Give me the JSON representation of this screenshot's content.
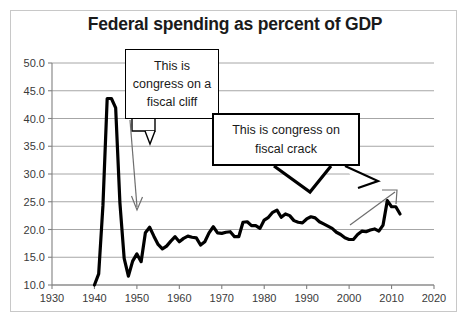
{
  "chart_data": {
    "type": "line",
    "title": "Federal spending as percent of GDP",
    "xlabel": "",
    "ylabel": "",
    "xlim": [
      1930,
      2020
    ],
    "ylim": [
      10.0,
      50.0
    ],
    "grid": true,
    "legend": "none",
    "x_ticks": [
      "1930",
      "1940",
      "1950",
      "1960",
      "1970",
      "1980",
      "1990",
      "2000",
      "2010",
      "2020"
    ],
    "y_ticks": [
      "10.0",
      "15.0",
      "20.0",
      "25.0",
      "30.0",
      "35.0",
      "40.0",
      "45.0",
      "50.0"
    ],
    "series": [
      {
        "name": "Federal spending as percent of GDP",
        "color": "#000000",
        "x": [
          1940,
          1941,
          1942,
          1943,
          1944,
          1945,
          1946,
          1947,
          1948,
          1949,
          1950,
          1951,
          1952,
          1953,
          1954,
          1955,
          1956,
          1957,
          1958,
          1959,
          1960,
          1961,
          1962,
          1963,
          1964,
          1965,
          1966,
          1967,
          1968,
          1969,
          1970,
          1971,
          1972,
          1973,
          1974,
          1975,
          1976,
          1977,
          1978,
          1979,
          1980,
          1981,
          1982,
          1983,
          1984,
          1985,
          1986,
          1987,
          1988,
          1989,
          1990,
          1991,
          1992,
          1993,
          1994,
          1995,
          1996,
          1997,
          1998,
          1999,
          2000,
          2001,
          2002,
          2003,
          2004,
          2005,
          2006,
          2007,
          2008,
          2009,
          2010,
          2011,
          2012
        ],
        "values": [
          10.0,
          12.0,
          24.3,
          43.6,
          43.6,
          41.9,
          24.8,
          14.8,
          11.6,
          14.3,
          15.6,
          14.2,
          19.4,
          20.4,
          18.8,
          17.3,
          16.5,
          17.0,
          17.9,
          18.7,
          17.8,
          18.4,
          18.8,
          18.6,
          18.5,
          17.2,
          17.8,
          19.4,
          20.5,
          19.4,
          19.3,
          19.5,
          19.6,
          18.7,
          18.7,
          21.3,
          21.4,
          20.7,
          20.7,
          20.2,
          21.7,
          22.2,
          23.1,
          23.5,
          22.2,
          22.8,
          22.5,
          21.6,
          21.3,
          21.2,
          21.9,
          22.3,
          22.1,
          21.4,
          21.0,
          20.6,
          20.2,
          19.5,
          19.1,
          18.5,
          18.2,
          18.2,
          19.1,
          19.7,
          19.6,
          19.9,
          20.1,
          19.7,
          20.8,
          25.2,
          24.1,
          24.1,
          22.8
        ]
      }
    ],
    "annotations": [
      {
        "name": "fiscal-cliff-callout",
        "lines": [
          "This is",
          "congress on a",
          "fiscal cliff"
        ],
        "points_to_year": 1951
      },
      {
        "name": "fiscal-crack-callout",
        "lines": [
          "This  is  congress on",
          "fiscal crack"
        ],
        "points_to_year": 2009
      }
    ]
  },
  "chart": {
    "title": "Federal spending as percent of GDP",
    "y_ticks": [
      {
        "label": "50.0",
        "value": 50.0
      },
      {
        "label": "45.0",
        "value": 45.0
      },
      {
        "label": "40.0",
        "value": 40.0
      },
      {
        "label": "35.0",
        "value": 35.0
      },
      {
        "label": "30.0",
        "value": 30.0
      },
      {
        "label": "25.0",
        "value": 25.0
      },
      {
        "label": "20.0",
        "value": 20.0
      },
      {
        "label": "15.0",
        "value": 15.0
      },
      {
        "label": "10.0",
        "value": 10.0
      }
    ],
    "x_ticks": [
      {
        "label": "1930",
        "value": 1930
      },
      {
        "label": "1940",
        "value": 1940
      },
      {
        "label": "1950",
        "value": 1950
      },
      {
        "label": "1960",
        "value": 1960
      },
      {
        "label": "1970",
        "value": 1970
      },
      {
        "label": "1980",
        "value": 1980
      },
      {
        "label": "1990",
        "value": 1990
      },
      {
        "label": "2000",
        "value": 2000
      },
      {
        "label": "2010",
        "value": 2010
      },
      {
        "label": "2020",
        "value": 2020
      }
    ],
    "callout_cliff": {
      "line1": "This is",
      "line2": "congress on a",
      "line3": "fiscal cliff"
    },
    "callout_crack": {
      "line1": "This  is  congress on",
      "line2": "fiscal crack"
    },
    "colors": {
      "line": "#000000",
      "grid": "#a6a6a6",
      "axis": "#808080",
      "frame": "#c8c8c8",
      "text": "#3a3a3a",
      "title": "#1a1a1a"
    }
  }
}
